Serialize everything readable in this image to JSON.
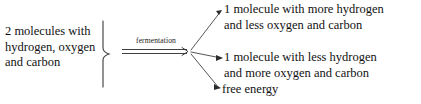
{
  "diagram": {
    "type": "reaction-scheme",
    "reactants": {
      "lines": [
        "2 molecules with",
        "hydrogen, oxygen",
        "and carbon"
      ]
    },
    "arrow": {
      "label": "fermentation",
      "style": "double-line-rightwards-arrow",
      "direction": "right"
    },
    "grouping": {
      "brace": "right-facing-curly-brace"
    },
    "branch_arrows": {
      "count": 3,
      "style": "thin-diagonal-arrow",
      "origin": "arrow-tip"
    },
    "products": [
      {
        "lines": [
          "1 molecule with more hydrogen",
          "and less oxygen and carbon"
        ]
      },
      {
        "lines": [
          "1 molecule with less hydrogen",
          "and more oxygen and carbon"
        ]
      },
      {
        "lines": [
          "free energy"
        ]
      }
    ],
    "colors": {
      "background": "#ffffff",
      "text": "#111111",
      "stroke": "#2b2b2b"
    }
  }
}
